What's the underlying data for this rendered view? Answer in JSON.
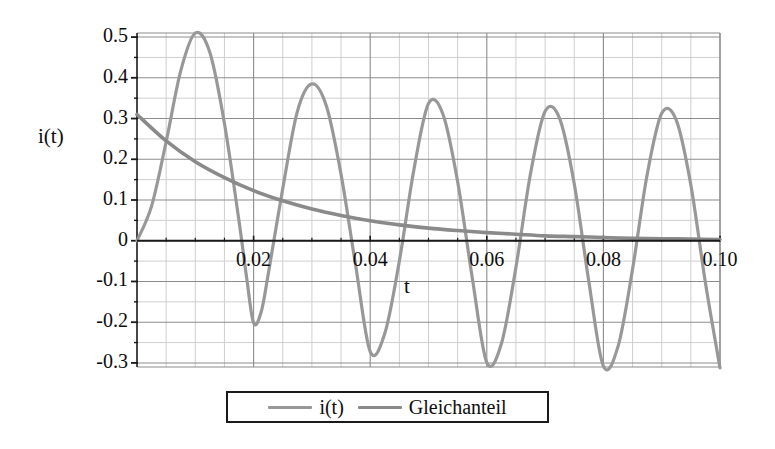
{
  "chart_data": {
    "type": "line",
    "title": "",
    "xlabel": "t",
    "ylabel": "i(t)",
    "xlim": [
      0,
      0.1
    ],
    "ylim": [
      -0.31,
      0.51
    ],
    "grid": true,
    "x_ticks": [
      0.02,
      0.04,
      0.06,
      0.08,
      0.1
    ],
    "x_tick_labels": [
      "0.02",
      "0.04",
      "0.06",
      "0.08",
      "0.10"
    ],
    "y_ticks": [
      0.5,
      0.4,
      0.3,
      0.2,
      0.1,
      0,
      -0.1,
      -0.2,
      -0.3
    ],
    "y_tick_labels": [
      "0.5",
      "0.4",
      "0.3",
      "0.2",
      "0.1",
      "0",
      "-0.1",
      "-0.2",
      "-0.3"
    ],
    "legend_position": "bottom",
    "series": [
      {
        "name": "i(t)",
        "color": "#989898",
        "linewidth": 3.2,
        "description": "Damped oscillation rising from 0, peaks decaying toward steady sinusoid",
        "peaks": [
          {
            "x": 0.01,
            "y": 0.51
          },
          {
            "x": 0.03,
            "y": 0.385
          },
          {
            "x": 0.05,
            "y": 0.337
          },
          {
            "x": 0.07,
            "y": 0.318
          },
          {
            "x": 0.09,
            "y": 0.313
          }
        ],
        "troughs": [
          {
            "x": 0.02,
            "y": -0.202
          },
          {
            "x": 0.04,
            "y": -0.272
          },
          {
            "x": 0.06,
            "y": -0.299
          },
          {
            "x": 0.08,
            "y": -0.308
          },
          {
            "x": 0.1,
            "y": -0.312
          }
        ],
        "points": [
          {
            "x": 0.0,
            "y": 0.0
          },
          {
            "x": 0.0025,
            "y": 0.085
          },
          {
            "x": 0.005,
            "y": 0.243
          },
          {
            "x": 0.0075,
            "y": 0.417
          },
          {
            "x": 0.01,
            "y": 0.51
          },
          {
            "x": 0.0125,
            "y": 0.462
          },
          {
            "x": 0.015,
            "y": 0.288
          },
          {
            "x": 0.0175,
            "y": 0.048
          },
          {
            "x": 0.0188,
            "y": -0.09
          },
          {
            "x": 0.02,
            "y": -0.202
          },
          {
            "x": 0.0213,
            "y": -0.175
          },
          {
            "x": 0.0225,
            "y": -0.083
          },
          {
            "x": 0.025,
            "y": 0.128
          },
          {
            "x": 0.0275,
            "y": 0.317
          },
          {
            "x": 0.03,
            "y": 0.385
          },
          {
            "x": 0.0325,
            "y": 0.33
          },
          {
            "x": 0.035,
            "y": 0.163
          },
          {
            "x": 0.0375,
            "y": -0.06
          },
          {
            "x": 0.04,
            "y": -0.272
          },
          {
            "x": 0.0425,
            "y": -0.228
          },
          {
            "x": 0.045,
            "y": -0.05
          },
          {
            "x": 0.0475,
            "y": 0.175
          },
          {
            "x": 0.05,
            "y": 0.337
          },
          {
            "x": 0.0525,
            "y": 0.31
          },
          {
            "x": 0.055,
            "y": 0.145
          },
          {
            "x": 0.0575,
            "y": -0.09
          },
          {
            "x": 0.06,
            "y": -0.299
          },
          {
            "x": 0.0625,
            "y": -0.253
          },
          {
            "x": 0.065,
            "y": -0.065
          },
          {
            "x": 0.0675,
            "y": 0.165
          },
          {
            "x": 0.07,
            "y": 0.318
          },
          {
            "x": 0.0725,
            "y": 0.3
          },
          {
            "x": 0.075,
            "y": 0.14
          },
          {
            "x": 0.0775,
            "y": -0.1
          },
          {
            "x": 0.08,
            "y": -0.308
          },
          {
            "x": 0.0825,
            "y": -0.26
          },
          {
            "x": 0.085,
            "y": -0.07
          },
          {
            "x": 0.0875,
            "y": 0.162
          },
          {
            "x": 0.09,
            "y": 0.313
          },
          {
            "x": 0.0925,
            "y": 0.296
          },
          {
            "x": 0.095,
            "y": 0.137
          },
          {
            "x": 0.0975,
            "y": -0.103
          },
          {
            "x": 0.1,
            "y": -0.312
          }
        ]
      },
      {
        "name": "Gleichanteil",
        "color": "#8a8a8a",
        "linewidth": 3.6,
        "description": "Exponentially decaying DC component from 0.31 toward 0",
        "points": [
          {
            "x": 0.0,
            "y": 0.31
          },
          {
            "x": 0.005,
            "y": 0.245
          },
          {
            "x": 0.01,
            "y": 0.194
          },
          {
            "x": 0.015,
            "y": 0.155
          },
          {
            "x": 0.02,
            "y": 0.123
          },
          {
            "x": 0.025,
            "y": 0.098
          },
          {
            "x": 0.03,
            "y": 0.078
          },
          {
            "x": 0.035,
            "y": 0.062
          },
          {
            "x": 0.04,
            "y": 0.049
          },
          {
            "x": 0.045,
            "y": 0.039
          },
          {
            "x": 0.05,
            "y": 0.031
          },
          {
            "x": 0.055,
            "y": 0.025
          },
          {
            "x": 0.06,
            "y": 0.02
          },
          {
            "x": 0.065,
            "y": 0.016
          },
          {
            "x": 0.07,
            "y": 0.012
          },
          {
            "x": 0.075,
            "y": 0.01
          },
          {
            "x": 0.08,
            "y": 0.008
          },
          {
            "x": 0.085,
            "y": 0.006
          },
          {
            "x": 0.09,
            "y": 0.005
          },
          {
            "x": 0.095,
            "y": 0.004
          },
          {
            "x": 0.1,
            "y": 0.003
          }
        ]
      }
    ],
    "legend": [
      {
        "label": "i(t)",
        "color": "#989898"
      },
      {
        "label": "Gleichanteil",
        "color": "#8a8a8a"
      }
    ],
    "colors": {
      "axis": "#1a1a1a",
      "grid_major": "#8c8c8c",
      "grid_minor": "#cfcfcf",
      "background": "#ffffff",
      "text": "#0d0d0d"
    }
  }
}
